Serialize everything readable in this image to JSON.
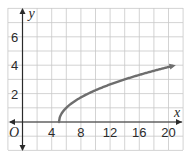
{
  "chart_data": {
    "type": "line",
    "title": "",
    "xlabel": "x",
    "ylabel": "y",
    "origin_label": "O",
    "xlim": [
      -2,
      22
    ],
    "ylim": [
      -2,
      8
    ],
    "grid": true,
    "x_ticks": [
      4,
      8,
      12,
      16,
      20
    ],
    "y_ticks": [
      2,
      4,
      6
    ],
    "series": [
      {
        "name": "y = sqrt(x - 5)",
        "x": [
          5,
          5.25,
          6,
          7,
          9,
          11,
          13,
          15,
          17,
          19,
          21
        ],
        "y": [
          0,
          0.5,
          1,
          1.41,
          2,
          2.45,
          2.83,
          3.16,
          3.46,
          3.74,
          4
        ],
        "color": "#6e6e6e",
        "arrow_end": true
      }
    ]
  },
  "colors": {
    "grid": "#c8c8c8",
    "axis": "#2a2a2a",
    "curve": "#6e6e6e"
  }
}
